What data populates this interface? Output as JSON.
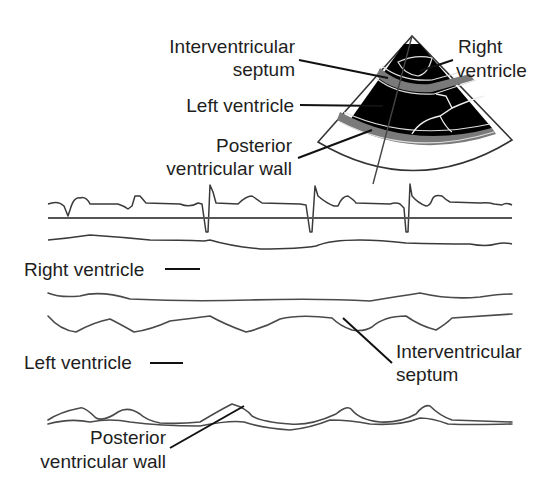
{
  "figure": {
    "sector_labels": {
      "septum": [
        "Interventricular",
        "septum"
      ],
      "right_ventricle": [
        "Right",
        "ventricle"
      ],
      "left_ventricle": "Left ventricle",
      "posterior_wall": [
        "Posterior",
        "ventricular wall"
      ]
    },
    "mmode_labels": {
      "right_ventricle": "Right ventricle",
      "left_ventricle": "Left ventricle",
      "septum": [
        "Interventricular",
        "septum"
      ],
      "posterior_wall": [
        "Posterior",
        "ventricular wall"
      ]
    },
    "ecg": {
      "qrs_complexes": 3
    },
    "colors": {
      "ink": "#1e1e1e",
      "trace": "#4a4a4a",
      "chamber": "#000000",
      "wall": "#7a7a7a"
    }
  }
}
